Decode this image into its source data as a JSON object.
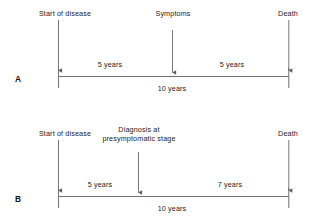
{
  "figure": {
    "type": "lead-time-bias-timeline-diagram",
    "background_color": "#ffffff",
    "line_color": "#6e6e6e",
    "text_color": "#1c1c1c"
  },
  "panels": [
    {
      "letter": "A",
      "timeline": {
        "total_label": "10 years",
        "start_label": "Start of disease",
        "end_label": "Death",
        "start_year": 0,
        "end_year": 10
      },
      "events": [
        {
          "name": "start-of-disease",
          "label": "Start of disease",
          "year": 0,
          "marker": "tick"
        },
        {
          "name": "symptoms",
          "label": "Symptoms",
          "year": 5,
          "marker": "arrow"
        },
        {
          "name": "death",
          "label": "Death",
          "year": 10,
          "marker": "tick"
        }
      ],
      "intervals": [
        {
          "name": "start-to-symptoms",
          "label": "5 years",
          "from_year": 0,
          "to_year": 5
        },
        {
          "name": "symptoms-to-death",
          "label": "5 years",
          "from_year": 5,
          "to_year": 10
        }
      ]
    },
    {
      "letter": "B",
      "timeline": {
        "total_label": "10 years",
        "start_label": "Start of disease",
        "end_label": "Death",
        "start_year": 0,
        "end_year": 10
      },
      "events": [
        {
          "name": "start-of-disease",
          "label": "Start of disease",
          "year": 0,
          "marker": "tick"
        },
        {
          "name": "diagnosis-presymptomatic",
          "label": "Diagnosis at presymptomatic stage",
          "year": 3.5,
          "marker": "arrow"
        },
        {
          "name": "death",
          "label": "Death",
          "year": 10,
          "marker": "tick"
        }
      ],
      "intervals": [
        {
          "name": "start-to-diagnosis",
          "label": "5 years",
          "from_year": 0,
          "to_year": 3.5
        },
        {
          "name": "diagnosis-to-death",
          "label": "7 years",
          "from_year": 3.5,
          "to_year": 10
        }
      ]
    }
  ]
}
